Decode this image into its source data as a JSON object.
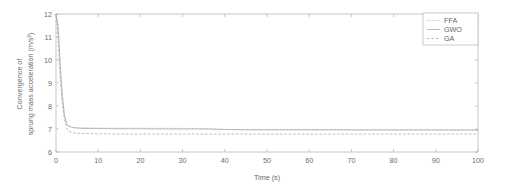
{
  "chart_data": {
    "type": "line",
    "title": "",
    "xlabel": "Time (s)",
    "ylabel": "Convergence of sprung mass acceleration (m/s²)",
    "ylabel_line1": "Convergence of",
    "ylabel_line2": "sprung mass acceleration (m/s²)",
    "xlim": [
      0,
      100
    ],
    "ylim": [
      6,
      12
    ],
    "xticks": [
      0,
      10,
      20,
      30,
      40,
      50,
      60,
      70,
      80,
      90,
      100
    ],
    "yticks": [
      6,
      7,
      8,
      9,
      10,
      11,
      12
    ],
    "xticklabels": [
      "0",
      "10",
      "20",
      "30",
      "40",
      "50",
      "60",
      "70",
      "80",
      "90",
      "100"
    ],
    "yticklabels": [
      "6",
      "7",
      "8",
      "9",
      "10",
      "11",
      "12"
    ],
    "grid": false,
    "legend_position": "top-right",
    "series": [
      {
        "name": "FFA",
        "color": "#9a9a9a",
        "style": "dotted",
        "x": [
          0,
          0.5,
          1,
          1.5,
          2,
          2.5,
          3,
          4,
          5,
          6,
          8,
          10,
          12,
          15,
          18,
          20,
          22,
          25,
          28,
          30,
          33,
          36,
          38,
          40,
          42,
          45,
          50,
          55,
          60,
          65,
          70,
          75,
          80,
          85,
          90,
          95,
          100
        ],
        "y": [
          12.0,
          11.2,
          9.4,
          8.3,
          7.55,
          7.22,
          7.12,
          7.07,
          7.06,
          7.05,
          7.05,
          7.05,
          7.04,
          7.04,
          7.04,
          7.04,
          7.03,
          7.03,
          7.03,
          7.03,
          7.02,
          7.02,
          7.0,
          6.98,
          6.97,
          6.97,
          6.97,
          6.96,
          6.96,
          6.96,
          6.96,
          6.96,
          6.96,
          6.96,
          6.96,
          6.95,
          6.95
        ]
      },
      {
        "name": "GWO",
        "color": "#a5a5a5",
        "style": "solid",
        "x": [
          0,
          0.5,
          1,
          1.5,
          2,
          2.5,
          3,
          4,
          5,
          6,
          8,
          10,
          12,
          15,
          18,
          20,
          25,
          30,
          35,
          38,
          40,
          45,
          50,
          55,
          60,
          65,
          70,
          75,
          80,
          85,
          90,
          95,
          100
        ],
        "y": [
          12.0,
          11.5,
          9.8,
          8.5,
          7.6,
          7.25,
          7.12,
          7.06,
          7.04,
          7.03,
          7.02,
          7.02,
          7.02,
          7.01,
          7.01,
          7.01,
          7.0,
          7.0,
          7.0,
          6.99,
          6.98,
          6.97,
          6.97,
          6.97,
          6.97,
          6.97,
          6.96,
          6.96,
          6.96,
          6.96,
          6.96,
          6.96,
          6.96
        ]
      },
      {
        "name": "GA",
        "color": "#a8a8a8",
        "style": "dashed",
        "x": [
          0,
          0.5,
          1,
          1.5,
          2,
          2.5,
          3,
          4,
          5,
          6,
          7,
          8,
          10,
          12,
          14,
          16,
          18,
          20,
          22,
          25,
          30,
          35,
          40,
          45,
          50,
          55,
          60,
          65,
          70,
          75,
          80,
          85,
          90,
          95,
          100
        ],
        "y": [
          12.0,
          11.0,
          9.2,
          8.1,
          7.4,
          7.05,
          6.9,
          6.84,
          6.82,
          6.81,
          6.8,
          6.8,
          6.79,
          6.79,
          6.78,
          6.78,
          6.78,
          6.78,
          6.78,
          6.78,
          6.78,
          6.78,
          6.78,
          6.78,
          6.78,
          6.78,
          6.78,
          6.78,
          6.78,
          6.78,
          6.78,
          6.78,
          6.78,
          6.78,
          6.78
        ]
      }
    ],
    "legend": [
      "FFA",
      "GWO",
      "GA"
    ]
  },
  "axes": {
    "frame_color": "#b9b9b9",
    "background": "#ffffff"
  }
}
